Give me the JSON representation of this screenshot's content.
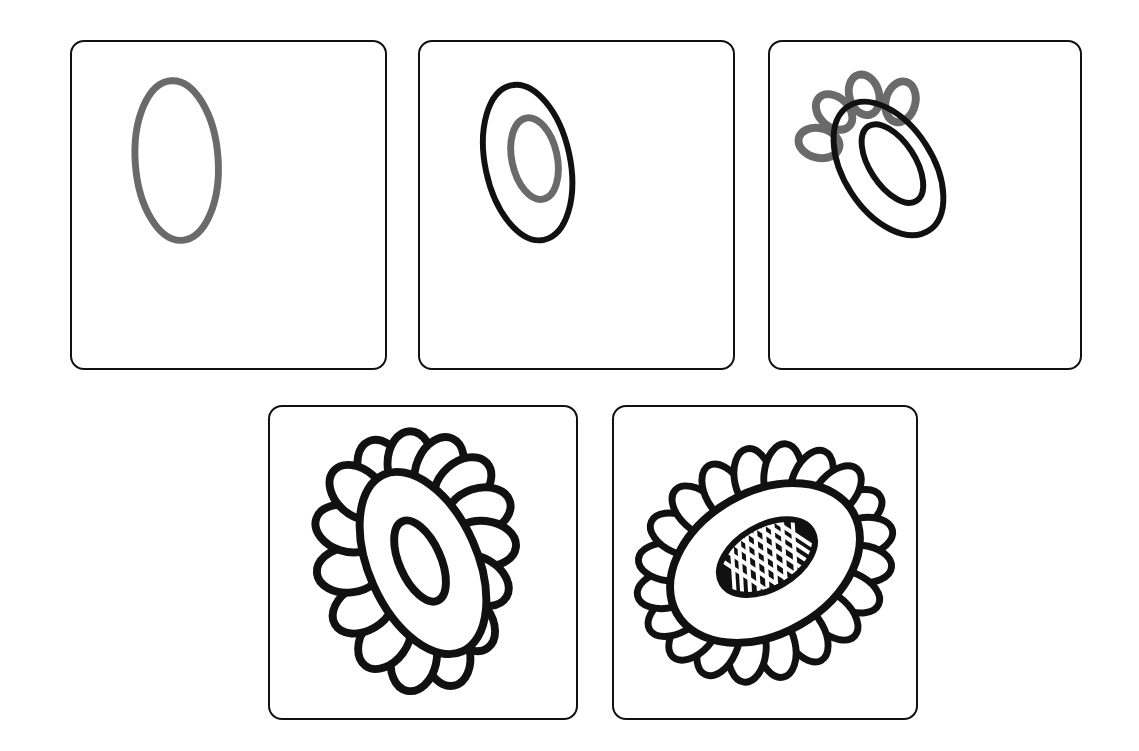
{
  "document": {
    "title": "Flower Drawing Tutorial",
    "type": "step-by-step drawing instructions",
    "background_color": "#ffffff",
    "canvas": {
      "width": 1139,
      "height": 751
    }
  },
  "style": {
    "new_stroke_color": "#6a6a6a",
    "existing_stroke_color": "#111111",
    "panel_border_color": "#111111",
    "panel_fill_color": "#ffffff",
    "panel_corner_radius": 14,
    "panel_border_width": 2
  },
  "layout": {
    "rows": [
      {
        "name": "top-row",
        "panel_count": 3
      },
      {
        "name": "bottom-row",
        "panel_count": 2
      }
    ],
    "total_panels": 5
  },
  "panels": [
    {
      "step": 1,
      "name": "step-1-outer-oval",
      "caption": "",
      "x": 70,
      "y": 40,
      "width": 317,
      "height": 330,
      "new_elements": [
        "outer oval outline"
      ],
      "existing_elements": [],
      "shapes": [
        {
          "id": "outer-oval",
          "kind": "ellipse",
          "color_role": "new",
          "cx": 176,
          "cy": 160,
          "rx": 42,
          "ry": 81,
          "rotation": -4,
          "stroke_width": 7
        }
      ]
    },
    {
      "step": 2,
      "name": "step-2-inner-oval",
      "caption": "",
      "x": 418,
      "y": 40,
      "width": 317,
      "height": 330,
      "new_elements": [
        "inner oval (flower centre)"
      ],
      "existing_elements": [
        "outer oval outline"
      ],
      "shapes": [
        {
          "id": "outer-oval",
          "kind": "ellipse",
          "color_role": "existing",
          "cx": 527,
          "cy": 162,
          "rx": 43,
          "ry": 80,
          "rotation": -12,
          "stroke_width": 6
        },
        {
          "id": "inner-oval",
          "kind": "ellipse",
          "color_role": "new",
          "cx": 534,
          "cy": 158,
          "rx": 23,
          "ry": 42,
          "rotation": -12,
          "stroke_width": 7
        }
      ]
    },
    {
      "step": 3,
      "name": "step-3-first-petals",
      "caption": "",
      "x": 768,
      "y": 40,
      "width": 314,
      "height": 330,
      "new_elements": [
        "four petals along top arc"
      ],
      "existing_elements": [
        "outer oval outline",
        "inner oval"
      ],
      "petal_count_added": 4,
      "shapes": [
        {
          "id": "outer-oval",
          "kind": "ellipse",
          "color_role": "existing",
          "cx": 888,
          "cy": 168,
          "rx": 45,
          "ry": 75,
          "rotation": -33,
          "stroke_width": 6
        },
        {
          "id": "inner-oval",
          "kind": "ellipse",
          "color_role": "existing",
          "cx": 892,
          "cy": 163,
          "rx": 23,
          "ry": 45,
          "rotation": -33,
          "stroke_width": 6
        },
        {
          "id": "petals",
          "kind": "petal-arc",
          "color_role": "new",
          "count": 4,
          "start_angle": -150,
          "end_angle": -20,
          "petal_rx": 14,
          "petal_ry": 20,
          "orbit_rx": 52,
          "orbit_ry": 80,
          "cx": 888,
          "cy": 168,
          "rotation": -33,
          "stroke_width": 7
        }
      ]
    },
    {
      "step": 4,
      "name": "step-4-all-petals",
      "caption": "",
      "x": 268,
      "y": 405,
      "width": 310,
      "height": 315,
      "new_elements": [
        "remaining petals completing the ring"
      ],
      "existing_elements": [
        "outer oval outline",
        "inner oval",
        "four petals"
      ],
      "petal_count_total": 15,
      "shapes": [
        {
          "id": "petals",
          "kind": "petal-ring",
          "color_role": "existing",
          "count": 15,
          "petal_rx": 23,
          "petal_ry": 33,
          "orbit_rx": 72,
          "orbit_ry": 96,
          "cx": 422,
          "cy": 562,
          "rotation": -24,
          "stroke_width": 7
        },
        {
          "id": "outer-oval",
          "kind": "ellipse",
          "color_role": "existing",
          "cx": 422,
          "cy": 562,
          "rx": 55,
          "ry": 98,
          "rotation": -24,
          "stroke_width": 7
        },
        {
          "id": "inner-oval",
          "kind": "ellipse",
          "color_role": "existing",
          "cx": 419,
          "cy": 560,
          "rx": 21,
          "ry": 44,
          "rotation": -24,
          "stroke_width": 7
        }
      ]
    },
    {
      "step": 5,
      "name": "step-5-seed-texture",
      "caption": "",
      "x": 612,
      "y": 405,
      "width": 306,
      "height": 315,
      "new_elements": [
        "crosshatched seed head fill in flower centre"
      ],
      "existing_elements": [
        "outer oval outline",
        "inner oval",
        "all petals"
      ],
      "petal_count_total": 20,
      "centre_fill": "black with white diagonal crosshatch (seeds)",
      "shapes": [
        {
          "id": "petals",
          "kind": "petal-ring",
          "color_role": "existing",
          "count": 20,
          "petal_rx": 19,
          "petal_ry": 32,
          "orbit_rx": 103,
          "orbit_ry": 82,
          "cx": 764,
          "cy": 562,
          "rotation": -30,
          "stroke_width": 6
        },
        {
          "id": "outer-oval",
          "kind": "ellipse",
          "color_role": "existing",
          "cx": 764,
          "cy": 562,
          "rx": 103,
          "ry": 72,
          "rotation": -30,
          "stroke_width": 7
        },
        {
          "id": "inner-oval",
          "kind": "ellipse",
          "color_role": "existing",
          "cx": 766,
          "cy": 557,
          "rx": 52,
          "ry": 31,
          "rotation": -30,
          "stroke_width": 7
        },
        {
          "id": "seed-hatch",
          "kind": "hatched-ellipse",
          "color_role": "new-filled",
          "cx": 766,
          "cy": 557,
          "rx": 50,
          "ry": 29,
          "rotation": -30,
          "hatch_spacing": 9
        }
      ]
    }
  ],
  "accessibility": {
    "alt_text": "Five-step line drawing tutorial showing how to draw a flower: an oval, an oval within an oval, petals added at the top, a full ring of petals, and finally a crosshatched seed centre."
  }
}
